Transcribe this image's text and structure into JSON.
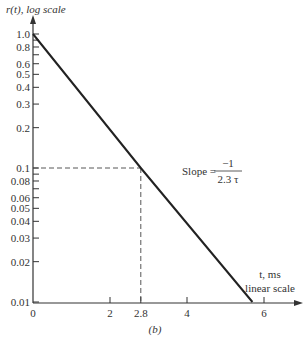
{
  "chart_data": {
    "type": "line",
    "title": "",
    "caption": "(b)",
    "ylabel": "r(t), log scale",
    "xlabel_line1": "t, ms",
    "xlabel_line2": "linear scale",
    "yscale": "log",
    "xscale": "linear",
    "ylim": [
      0.01,
      1.0
    ],
    "xlim": [
      0,
      6.4
    ],
    "grid": false,
    "y_ticks": [
      1.0,
      0.8,
      0.6,
      0.5,
      0.4,
      0.3,
      0.2,
      0.1,
      0.08,
      0.06,
      0.05,
      0.04,
      0.03,
      0.02,
      0.01
    ],
    "y_tick_labels": [
      "1.0",
      "0.8",
      "0.6",
      "0.5",
      "0.4",
      "0.3",
      "0.2",
      "0.1",
      "0.08",
      "0.06",
      "0.05",
      "0.04",
      "0.03",
      "0.02",
      "0.01"
    ],
    "y_minor_ticks": [
      0.9,
      0.7,
      0.09,
      0.07
    ],
    "x_ticks": [
      0,
      2,
      2.8,
      4,
      6
    ],
    "x_tick_labels": [
      "0",
      "2",
      "2.8",
      "4",
      "6"
    ],
    "series": [
      {
        "name": "r(t)",
        "x": [
          0,
          2.8,
          5.7
        ],
        "y": [
          1.0,
          0.1,
          0.01
        ]
      }
    ],
    "annotations": [
      {
        "type": "dashed-guide",
        "x": 2.8,
        "y": 0.1,
        "description": "dashed lines from axes to point (2.8, 0.1)"
      },
      {
        "type": "text",
        "label": "Slope =",
        "numerator": "−1",
        "denominator": "2.3 τ",
        "x": 3.85,
        "y": 0.085
      }
    ]
  }
}
